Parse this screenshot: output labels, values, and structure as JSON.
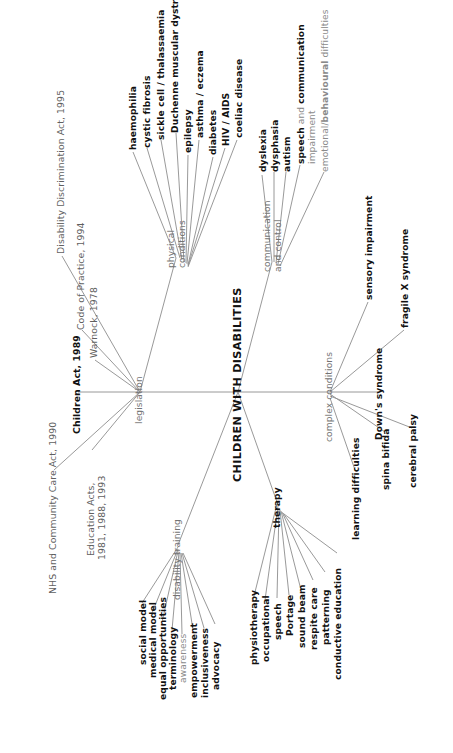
{
  "diagram": {
    "title": "CHILDREN WITH DISABILITIES",
    "type": "mind-map",
    "orientation": "rotated-90-ccw",
    "line_color": "#8d8d8d",
    "background": "#ffffff"
  },
  "root": {
    "label": "CHILDREN WITH DISABILITIES"
  },
  "branches": {
    "legislation": {
      "label": "legislation",
      "children": [
        {
          "label": "Disability Discrimination Act, 1995",
          "weight": "light"
        },
        {
          "label": "Code of Practice, 1994",
          "weight": "light"
        },
        {
          "label": "Warnock, 1978",
          "weight": "light"
        },
        {
          "label": "Children Act, 1989",
          "weight": "bold"
        },
        {
          "label": "NHS and Community Care Act, 1990",
          "weight": "light"
        },
        {
          "label": "Education Acts,",
          "label2": "1981, 1988, 1993",
          "weight": "light"
        }
      ]
    },
    "physical_conditions": {
      "label": "physical",
      "label2": "conditions",
      "children": [
        {
          "label": "haemophilia",
          "weight": "bold"
        },
        {
          "label": "cystic fibrosis",
          "weight": "bold"
        },
        {
          "label": "sickle cell / thalassaemia",
          "weight": "bold"
        },
        {
          "label": "Duchenne muscular dystrophy",
          "weight": "bold"
        },
        {
          "label": "epilepsy",
          "weight": "bold"
        },
        {
          "label": "asthma / eczema",
          "weight": "bold"
        },
        {
          "label": "diabetes",
          "weight": "bold"
        },
        {
          "label": "HIV / AIDS",
          "weight": "bold"
        },
        {
          "label": "coeliac disease",
          "weight": "bold"
        }
      ]
    },
    "communication_and_control": {
      "label": "communication",
      "label2": "and control",
      "children": [
        {
          "label": "dyslexia",
          "weight": "bold"
        },
        {
          "label": "dysphasia",
          "weight": "bold"
        },
        {
          "label": "autism",
          "weight": "bold"
        },
        {
          "label": "speech and communication",
          "label2": "impairment",
          "weight": "mixed"
        },
        {
          "label": "emotional/behavioural difficulties",
          "weight": "mixed"
        }
      ]
    },
    "complex_conditions": {
      "label": "complex conditions",
      "children": [
        {
          "label": "sensory impairment",
          "weight": "bold"
        },
        {
          "label": "fragile X syndrome",
          "weight": "bold"
        },
        {
          "label": "Down's syndrome",
          "weight": "bold"
        },
        {
          "label": "spina bifida",
          "weight": "bold"
        },
        {
          "label": "cerebral palsy",
          "weight": "bold"
        },
        {
          "label": "learning difficulties",
          "weight": "bold"
        }
      ]
    },
    "therapy": {
      "label": "therapy",
      "children": [
        {
          "label": "physiotherapy",
          "weight": "bold"
        },
        {
          "label": "occupational",
          "weight": "bold"
        },
        {
          "label": "speech",
          "weight": "bold"
        },
        {
          "label": "Portage",
          "weight": "bold"
        },
        {
          "label": "sound beam",
          "weight": "bold"
        },
        {
          "label": "respite care",
          "weight": "bold"
        },
        {
          "label": "patterning",
          "weight": "bold"
        },
        {
          "label": "conductive education",
          "weight": "bold"
        }
      ]
    },
    "disability_training": {
      "label": "disability training",
      "children": [
        {
          "label": "social model",
          "weight": "bold"
        },
        {
          "label": "medical model",
          "weight": "bold"
        },
        {
          "label": "equal opportunities",
          "weight": "bold"
        },
        {
          "label": "terminology",
          "weight": "bold"
        },
        {
          "label": "awareness",
          "weight": "light"
        },
        {
          "label": "empowerment",
          "weight": "bold"
        },
        {
          "label": "inclusiveness",
          "weight": "bold"
        },
        {
          "label": "advocacy",
          "weight": "bold"
        }
      ]
    }
  }
}
